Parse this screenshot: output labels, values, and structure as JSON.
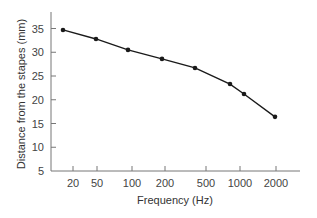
{
  "chart_data": {
    "type": "line",
    "title": "",
    "xlabel": "Frequency (Hz)",
    "ylabel": "Distance from the stapes (mm)",
    "x_ticks": [
      20,
      50,
      100,
      200,
      500,
      1000,
      2000
    ],
    "y_ticks": [
      5,
      10,
      15,
      20,
      25,
      30,
      35
    ],
    "ylim": [
      5,
      37
    ],
    "grid": false,
    "legend": null,
    "series": [
      {
        "name": "Distance vs frequency",
        "x": [
          16,
          50,
          95,
          190,
          400,
          800,
          1100,
          2000
        ],
        "y": [
          34.7,
          32.8,
          30.5,
          28.6,
          26.7,
          23.3,
          21.2,
          16.4
        ]
      }
    ]
  },
  "layout": {
    "plot": {
      "x0": 51,
      "y_axis_top": 12,
      "x_axis_y": 171,
      "x_axis_end": 300
    },
    "x_tick_px": [
      73,
      97,
      132,
      165,
      206,
      240,
      276
    ],
    "point_px_x": [
      63,
      96,
      128,
      162,
      195,
      230,
      244,
      275
    ],
    "colors": {
      "line": "#1a1a1a",
      "axis": "#777777",
      "text": "#444444"
    }
  }
}
